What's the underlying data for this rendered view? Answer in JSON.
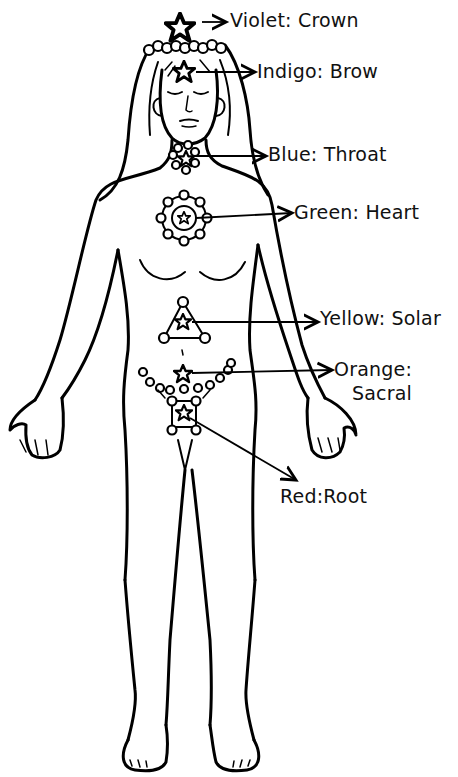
{
  "diagram": {
    "ink_color": "#000000",
    "background": "#ffffff",
    "chakras": [
      {
        "color": "Violet",
        "name": "Crown",
        "label": "Violet: Crown",
        "symbol": "star-icon"
      },
      {
        "color": "Indigo",
        "name": "Brow",
        "label": "Indigo: Brow",
        "symbol": "star-icon"
      },
      {
        "color": "Blue",
        "name": "Throat",
        "label": "Blue: Throat",
        "symbol": "star-bead-cluster"
      },
      {
        "color": "Green",
        "name": "Heart",
        "label": "Green: Heart",
        "symbol": "star-circle-beads"
      },
      {
        "color": "Yellow",
        "name": "Solar",
        "label": "Yellow: Solar",
        "symbol": "star-triangle"
      },
      {
        "color": "Orange",
        "name": "Sacral",
        "label_line1": "Orange:",
        "label_line2": "Sacral",
        "symbol": "star-bead-chain"
      },
      {
        "color": "Red",
        "name": "Root",
        "label": "Red:Root",
        "symbol": "star-square"
      }
    ]
  }
}
